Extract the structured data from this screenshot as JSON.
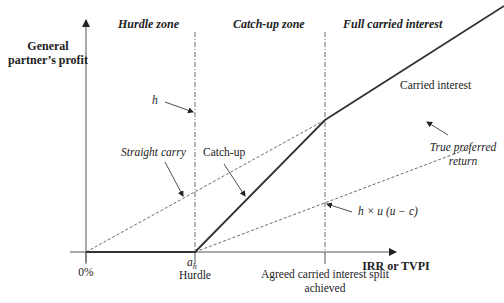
{
  "zones": {
    "hurdle": "Hurdle zone",
    "catchup": "Catch-up zone",
    "full": "Full carried interest"
  },
  "y_axis": {
    "label_line1": "General",
    "label_line2": "partner’s profit"
  },
  "x_axis": {
    "label": "IRR or TVPI",
    "ticks": {
      "zero": "0%",
      "hurdle_symbol": "a",
      "hurdle_subscript": "h",
      "hurdle": "Hurdle",
      "split_line1": "Agreed carried interest split",
      "split_line2": "achieved"
    }
  },
  "annotations": {
    "h": "h",
    "straight_carry": "Straight carry",
    "catch_up": "Catch-up",
    "carried_interest": "Carried interest",
    "true_pref_line1": "True preferred",
    "true_pref_line2": "return",
    "formula": "h × u (u − c)"
  },
  "colors": {
    "line": "#333333",
    "axis": "#555555",
    "text": "#222222"
  }
}
